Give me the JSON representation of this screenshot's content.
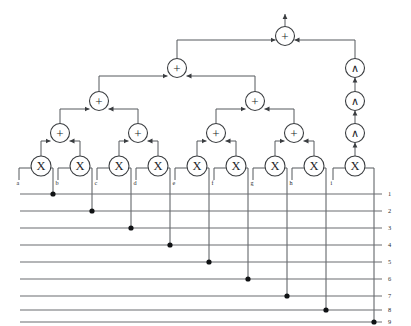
{
  "diagram": {
    "background_color": "#ffffff",
    "wire_color": "#55585c",
    "node_stroke_color": "#3a3d40",
    "node_fill_color": "#ffffff",
    "dot_color": "#101214",
    "label_color": "#2a2c2e",
    "canvas": {
      "width": 411,
      "height": 326
    }
  },
  "glyphs": {
    "multiply": "X",
    "add": "+",
    "wedge": "∧"
  },
  "multiplier_nodes": [
    {
      "id": "mul-a",
      "glyph": "X",
      "label": "a",
      "cx": 41,
      "cy": 166,
      "r": 10,
      "drop_x": 53,
      "bus": 1
    },
    {
      "id": "mul-b",
      "glyph": "X",
      "label": "b",
      "cx": 80,
      "cy": 166,
      "r": 10,
      "drop_x": 92,
      "bus": 2
    },
    {
      "id": "mul-c",
      "glyph": "X",
      "label": "c",
      "cx": 119,
      "cy": 166,
      "r": 10,
      "drop_x": 131,
      "bus": 3
    },
    {
      "id": "mul-d",
      "glyph": "X",
      "label": "d",
      "cx": 158,
      "cy": 166,
      "r": 10,
      "drop_x": 170,
      "bus": 4
    },
    {
      "id": "mul-e",
      "glyph": "X",
      "label": "e",
      "cx": 197,
      "cy": 166,
      "r": 10,
      "drop_x": 209,
      "bus": 5
    },
    {
      "id": "mul-f",
      "glyph": "X",
      "label": "f",
      "cx": 236,
      "cy": 166,
      "r": 10,
      "drop_x": 248,
      "bus": 6
    },
    {
      "id": "mul-g",
      "glyph": "X",
      "label": "g",
      "cx": 275,
      "cy": 166,
      "r": 10,
      "drop_x": 287,
      "bus": 7
    },
    {
      "id": "mul-h",
      "glyph": "X",
      "label": "h",
      "cx": 314,
      "cy": 166,
      "r": 10,
      "drop_x": 326,
      "bus": 8
    },
    {
      "id": "mul-i",
      "glyph": "X",
      "label": "i",
      "cx": 355,
      "cy": 166,
      "r": 10,
      "drop_x": 374,
      "bus": 9
    }
  ],
  "adder_nodes": [
    {
      "id": "add-l1-0",
      "glyph": "+",
      "cx": 60,
      "cy": 133,
      "r": 9.5,
      "level": 1
    },
    {
      "id": "add-l1-1",
      "glyph": "+",
      "cx": 138,
      "cy": 133,
      "r": 9.5,
      "level": 1
    },
    {
      "id": "add-l1-2",
      "glyph": "+",
      "cx": 216,
      "cy": 133,
      "r": 9.5,
      "level": 1
    },
    {
      "id": "add-l1-3",
      "glyph": "+",
      "cx": 294,
      "cy": 133,
      "r": 9.5,
      "level": 1
    },
    {
      "id": "add-l2-0",
      "glyph": "+",
      "cx": 99,
      "cy": 101,
      "r": 9.5,
      "level": 2
    },
    {
      "id": "add-l2-1",
      "glyph": "+",
      "cx": 255,
      "cy": 101,
      "r": 9.5,
      "level": 2
    },
    {
      "id": "add-l3-0",
      "glyph": "+",
      "cx": 177,
      "cy": 68,
      "r": 9.5,
      "level": 3
    },
    {
      "id": "add-root",
      "glyph": "+",
      "cx": 285,
      "cy": 36,
      "r": 9.5,
      "level": 4
    }
  ],
  "wedge_nodes": [
    {
      "id": "wedge-0",
      "glyph": "∧",
      "cx": 355,
      "cy": 133,
      "r": 9.5
    },
    {
      "id": "wedge-1",
      "glyph": "∧",
      "cx": 355,
      "cy": 101,
      "r": 9.5
    },
    {
      "id": "wedge-2",
      "glyph": "∧",
      "cx": 355,
      "cy": 68,
      "r": 9.5
    }
  ],
  "input_labels": [
    "a",
    "b",
    "c",
    "d",
    "e",
    "f",
    "g",
    "h",
    "i"
  ],
  "output_bus": {
    "x_start": 20,
    "x_end": 382,
    "label_x": 388,
    "lines": [
      {
        "number": "1",
        "y": 194,
        "dot_x": 53
      },
      {
        "number": "2",
        "y": 211,
        "dot_x": 92
      },
      {
        "number": "3",
        "y": 228,
        "dot_x": 131
      },
      {
        "number": "4",
        "y": 245,
        "dot_x": 170
      },
      {
        "number": "5",
        "y": 262,
        "dot_x": 209
      },
      {
        "number": "6",
        "y": 279,
        "dot_x": 248
      },
      {
        "number": "7",
        "y": 296,
        "dot_x": 287
      },
      {
        "number": "8",
        "y": 310,
        "dot_x": 326
      },
      {
        "number": "9",
        "y": 322,
        "dot_x": 374
      }
    ]
  },
  "root_output": {
    "label": "",
    "arrow_tip_y": 14
  }
}
